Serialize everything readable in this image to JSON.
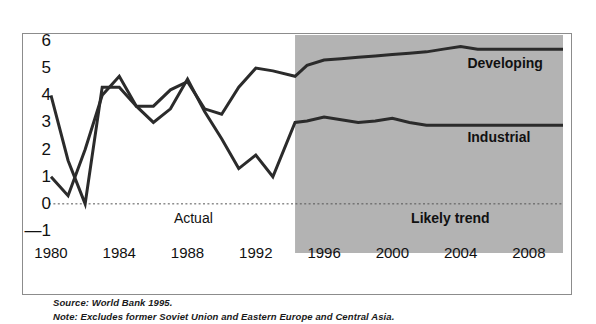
{
  "figure": {
    "source_note": "Source: World Bank 1995.",
    "excludes_note": "Note: Excludes former Soviet Union and Eastern Europe and Central Asia."
  },
  "annotations": {
    "actual": "Actual",
    "likely_trend": "Likely trend",
    "developing": "Developing",
    "industrial": "Industrial"
  },
  "colors": {
    "line": "#2b2b2b",
    "forecast_band": "#b3b3b3",
    "border": "#8c8c8c",
    "text": "#111111",
    "zero_line": "#555555"
  },
  "chart_data": {
    "type": "line",
    "title": "",
    "xlabel": "",
    "ylabel": "",
    "xlim": [
      1980,
      2010
    ],
    "ylim": [
      -1,
      6
    ],
    "yticks": [
      6,
      5,
      4,
      3,
      2,
      1,
      0,
      "—1"
    ],
    "ytick_values": [
      6,
      5,
      4,
      3,
      2,
      1,
      0,
      -1
    ],
    "xticks": [
      1980,
      1984,
      1988,
      1992,
      1996,
      2000,
      2004,
      2008
    ],
    "grid": false,
    "zero_reference_line": true,
    "legend": "inline-labels",
    "forecast_start": 1994.3,
    "regions": [
      {
        "label": "Actual",
        "from": 1980,
        "to": 1994.3,
        "shaded": false
      },
      {
        "label": "Likely trend",
        "from": 1994.3,
        "to": 2010,
        "shaded": true
      }
    ],
    "x": [
      1980,
      1981,
      1982,
      1983,
      1984,
      1985,
      1986,
      1987,
      1988,
      1989,
      1990,
      1991,
      1992,
      1993,
      1994.3,
      1995,
      1996,
      1997,
      1998,
      1999,
      2000,
      2001,
      2002,
      2003,
      2004,
      2005,
      2006,
      2007,
      2008,
      2009,
      2010
    ],
    "series": [
      {
        "name": "Developing",
        "values": [
          1.0,
          0.3,
          2.0,
          4.0,
          4.7,
          3.6,
          3.6,
          4.2,
          4.5,
          3.5,
          3.3,
          4.3,
          5.0,
          4.9,
          4.7,
          5.1,
          5.3,
          5.35,
          5.4,
          5.45,
          5.5,
          5.55,
          5.6,
          5.7,
          5.8,
          5.7,
          5.7,
          5.7,
          5.7,
          5.7,
          5.7
        ]
      },
      {
        "name": "Industrial",
        "values": [
          4.0,
          1.6,
          0.0,
          4.3,
          4.3,
          3.6,
          3.0,
          3.5,
          4.6,
          3.4,
          2.4,
          1.3,
          1.8,
          1.0,
          3.0,
          3.05,
          3.2,
          3.1,
          3.0,
          3.05,
          3.15,
          3.0,
          2.9,
          2.9,
          2.9,
          2.9,
          2.9,
          2.9,
          2.9,
          2.9,
          2.9
        ]
      }
    ]
  }
}
